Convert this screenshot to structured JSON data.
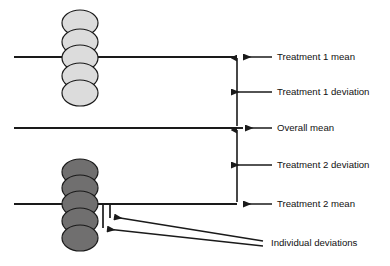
{
  "figure": {
    "background": "#ffffff",
    "width": 390,
    "height": 266
  },
  "colors": {
    "line": "#1a1a1a",
    "text": "#111111",
    "group1_fill": "#dcdcdc",
    "group2_fill": "#706f6f",
    "marker_stroke": "#1a1a1a"
  },
  "labels": {
    "treatment1_mean": "Treatment 1 mean",
    "treatment1_deviation": "Treatment 1 deviation",
    "overall_mean": "Overall mean",
    "treatment2_deviation": "Treatment 2 deviation",
    "treatment2_mean": "Treatment 2 mean",
    "individual_deviations": "Individual deviations"
  },
  "reference_lines": [
    {
      "name": "treatment-1-mean-line",
      "y": 57,
      "x1": 14,
      "x2": 237
    },
    {
      "name": "overall-mean-line",
      "y": 128,
      "x1": 14,
      "x2": 237
    },
    {
      "name": "treatment-2-mean-line",
      "y": 204,
      "x1": 14,
      "x2": 237
    }
  ],
  "groups": [
    {
      "name": "treatment-1",
      "fill": "#dcdcdc",
      "center_x": 80,
      "point_count": 5,
      "point_y": [
        23,
        42,
        58,
        76,
        93
      ]
    },
    {
      "name": "treatment-2",
      "fill": "#706f6f",
      "center_x": 80,
      "point_count": 5,
      "point_y": [
        172,
        188,
        204,
        221,
        238
      ]
    }
  ],
  "bracket": {
    "x": 237,
    "top_y": 57,
    "bottom_y": 204,
    "mid_y": 128
  },
  "individual_deviation_ticks": [
    {
      "x": 103,
      "y1": 204,
      "y2": 228
    },
    {
      "x": 110,
      "y1": 204,
      "y2": 218
    }
  ]
}
